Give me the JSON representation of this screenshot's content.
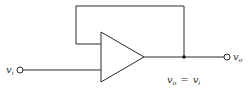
{
  "diagram": {
    "input_label": {
      "main": "v",
      "sub": "i"
    },
    "output_label": {
      "main": "v",
      "sub": "o"
    },
    "equation": {
      "lhs_main": "v",
      "lhs_sub": "o",
      "op": "=",
      "rhs_main": "v",
      "rhs_sub": "i"
    },
    "components": [
      {
        "type": "op-amp",
        "name": "amplifier"
      },
      {
        "type": "terminal",
        "name": "input-terminal"
      },
      {
        "type": "terminal",
        "name": "output-terminal"
      },
      {
        "type": "junction",
        "name": "feedback-junction"
      }
    ],
    "colors": {
      "line": "#2a2a2a",
      "text": "#333333",
      "background": "#ffffff"
    }
  }
}
